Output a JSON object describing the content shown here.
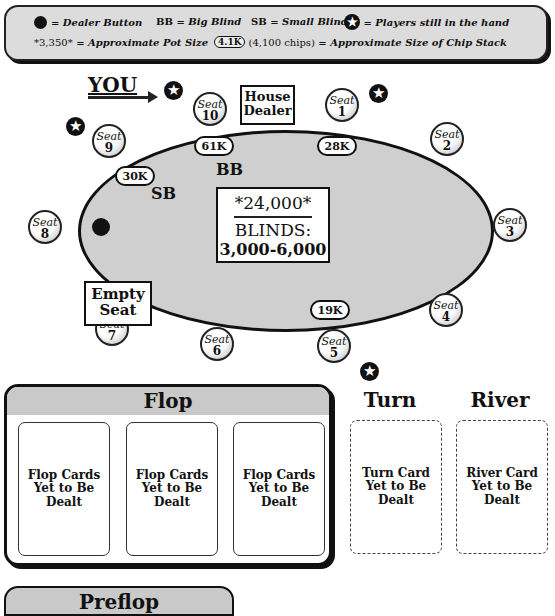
{
  "legend": {
    "dealer_button": "= Dealer Button",
    "bb_key": "BB",
    "bb_desc": "= Big Blind",
    "sb_key": "SB",
    "sb_desc": "= Small Blind",
    "players_desc": "= Players still in the hand",
    "pot_example": "*3,350*",
    "pot_desc": "= Approximate Pot Size",
    "chip_example": "4.1K",
    "chip_example_detail": "(4,100 chips)",
    "chip_desc": "= Approximate Size of Chip Stack",
    "icons": {
      "dealer": "filled-black-circle",
      "player": "star-in-circle"
    }
  },
  "table": {
    "you_label": "YOU",
    "house_dealer": [
      "House",
      "Dealer"
    ],
    "empty_seat": [
      "Empty",
      "Seat"
    ],
    "seat_word": "Seat",
    "seats": [
      {
        "num": "1",
        "stack": "28K",
        "in_hand": true
      },
      {
        "num": "2",
        "stack": "",
        "in_hand": false
      },
      {
        "num": "3",
        "stack": "",
        "in_hand": false
      },
      {
        "num": "4",
        "stack": "",
        "in_hand": false
      },
      {
        "num": "5",
        "stack": "19K",
        "in_hand": true
      },
      {
        "num": "6",
        "stack": "",
        "in_hand": false
      },
      {
        "num": "7",
        "stack": "",
        "in_hand": false,
        "empty": true
      },
      {
        "num": "8",
        "stack": "",
        "in_hand": false,
        "dealer_button": true
      },
      {
        "num": "9",
        "stack": "30K",
        "in_hand": true,
        "blind": "SB"
      },
      {
        "num": "10",
        "stack": "61K",
        "in_hand": true,
        "blind": "BB",
        "is_you": true
      }
    ],
    "bb_tag": "BB",
    "sb_tag": "SB",
    "pot": "*24,000*",
    "blinds_label": "BLINDS:",
    "blinds_value": "3,000-6,000",
    "star_glyph": "✪"
  },
  "board": {
    "flop_title": "Flop",
    "flop_cards": [
      [
        "Flop Cards",
        "Yet to Be",
        "Dealt"
      ],
      [
        "Flop Cards",
        "Yet to Be",
        "Dealt"
      ],
      [
        "Flop Cards",
        "Yet to Be",
        "Dealt"
      ]
    ],
    "turn_title": "Turn",
    "turn_card": [
      "Turn Card",
      "Yet to Be",
      "Dealt"
    ],
    "river_title": "River",
    "river_card": [
      "River Card",
      "Yet to Be",
      "Dealt"
    ],
    "next_section_title": "Preflop"
  }
}
